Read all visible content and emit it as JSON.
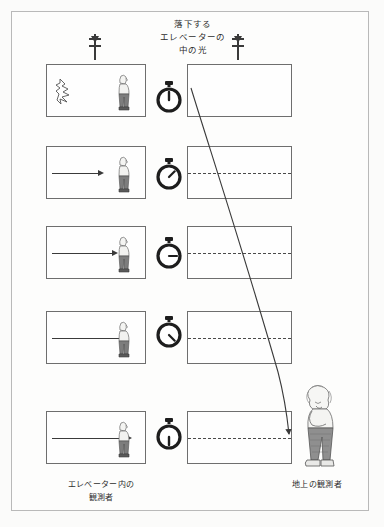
{
  "figure": {
    "title_lines": [
      "落下する",
      "エレベーターの",
      "中の光"
    ],
    "caption_elevator_lines": [
      "エレベーター内の",
      "観測者"
    ],
    "caption_ground_lines": [
      "地上の観測者"
    ],
    "colors": {
      "background": "#fbfbfa",
      "frame_border": "#b9b9b9",
      "box_border": "#6e6e6e",
      "ink": "#3a3a3a",
      "dashed_line": "#4a4a4a",
      "shirt": "#f2f2f0",
      "trousers": "#7d7d7d"
    },
    "rows": [
      {
        "index": 1,
        "stopwatch_label": "12 o'clock",
        "stopwatch_angle_deg": 0,
        "left_panel": {
          "flash": true,
          "ray_length": 0,
          "person": true
        },
        "right_panel": {
          "dashed_midline": false
        }
      },
      {
        "index": 2,
        "stopwatch_label": "1-2 o'clock",
        "stopwatch_angle_deg": 45,
        "left_panel": {
          "flash": false,
          "ray_length": 48,
          "person": true
        },
        "right_panel": {
          "dashed_midline": true
        }
      },
      {
        "index": 3,
        "stopwatch_label": "3 o'clock",
        "stopwatch_angle_deg": 90,
        "left_panel": {
          "flash": false,
          "ray_length": 66,
          "person": true
        },
        "right_panel": {
          "dashed_midline": true
        }
      },
      {
        "index": 4,
        "stopwatch_label": "4-5 o'clock",
        "stopwatch_angle_deg": 135,
        "left_panel": {
          "flash": false,
          "ray_length": 76,
          "person": true
        },
        "right_panel": {
          "dashed_midline": true
        }
      },
      {
        "index": 5,
        "stopwatch_label": "6 o'clock",
        "stopwatch_angle_deg": 180,
        "left_panel": {
          "flash": false,
          "ray_length": 82,
          "person": true
        },
        "right_panel": {
          "dashed_midline": true
        }
      }
    ],
    "fall_arrows": [
      {
        "name": "left-column-fall-arrow"
      },
      {
        "name": "right-column-fall-arrow"
      }
    ],
    "light_path_curve": {
      "description": "curved light path seen by ground observer",
      "has_arrowhead": true
    }
  }
}
